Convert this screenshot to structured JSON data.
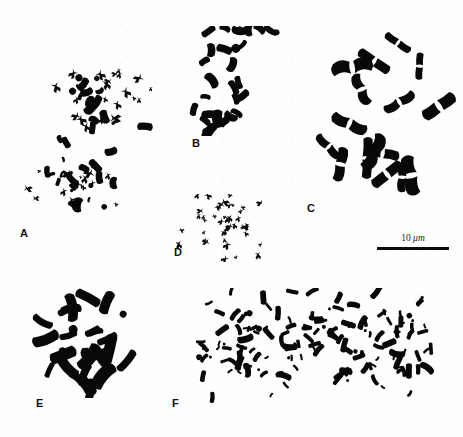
{
  "figure": {
    "kind": "chromosome-spread-plate",
    "background_color": "#fefefe",
    "ink_color": "#080808",
    "width": 463,
    "height": 437
  },
  "scalebar": {
    "value": "10",
    "unit": "μm",
    "text": "10 μm",
    "length_px": 72,
    "x": 377,
    "y": 233,
    "color": "#0d0d0d"
  },
  "panels": [
    {
      "label": "A",
      "label_x": 20,
      "label_y": 228,
      "box": {
        "x": 14,
        "y": 50,
        "w": 152,
        "h": 180
      },
      "description": "large dispersed spread of small cross-shaped and rod chromosomes in two loose clusters",
      "chromosome_count": 78,
      "morphology": "mixed-small-cross",
      "seed": 1701
    },
    {
      "label": "B",
      "label_x": 192,
      "label_y": 138,
      "box": {
        "x": 188,
        "y": 26,
        "w": 92,
        "h": 110
      },
      "description": "moderate spread of medium thick rod and dot chromosomes",
      "chromosome_count": 30,
      "morphology": "medium-rod",
      "seed": 2213
    },
    {
      "label": "C",
      "label_x": 307,
      "label_y": 203,
      "box": {
        "x": 305,
        "y": 10,
        "w": 156,
        "h": 192
      },
      "description": "few very large metacentric chromosomes with visible centromeric constrictions",
      "chromosome_count": 16,
      "morphology": "large-metacentric",
      "seed": 3307
    },
    {
      "label": "D",
      "label_x": 174,
      "label_y": 247,
      "box": {
        "x": 176,
        "y": 194,
        "w": 86,
        "h": 68
      },
      "description": "compact round cluster of small cross-shaped chromosomes",
      "chromosome_count": 42,
      "morphology": "small-cross",
      "seed": 4409
    },
    {
      "label": "E",
      "label_x": 36,
      "label_y": 398,
      "box": {
        "x": 18,
        "y": 286,
        "w": 132,
        "h": 112
      },
      "description": "radial spread of thick blunt rod chromosomes",
      "chromosome_count": 28,
      "morphology": "thick-rod",
      "seed": 5501
    },
    {
      "label": "F",
      "label_x": 172,
      "label_y": 398,
      "box": {
        "x": 176,
        "y": 288,
        "w": 272,
        "h": 120
      },
      "description": "very dense wide spread of numerous small rod chromosomes",
      "chromosome_count": 150,
      "morphology": "dense-small-rod",
      "seed": 6607
    }
  ]
}
